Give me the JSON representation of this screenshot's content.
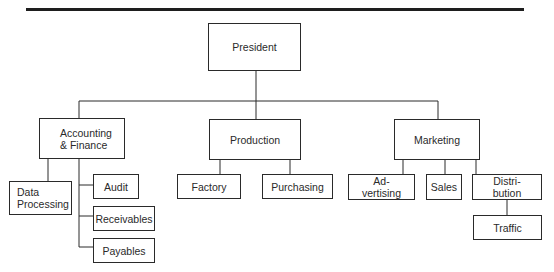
{
  "chart": {
    "root": {
      "label": "President"
    },
    "departments": [
      {
        "label": "Accounting\n& Finance",
        "children": [
          {
            "label": "Data\nProcessing"
          },
          {
            "label": "Audit"
          },
          {
            "label": "Receivables"
          },
          {
            "label": "Payables"
          }
        ]
      },
      {
        "label": "Production",
        "children": [
          {
            "label": "Factory"
          },
          {
            "label": "Purchasing"
          }
        ]
      },
      {
        "label": "Marketing",
        "children": [
          {
            "label": "Ad-\nvertising"
          },
          {
            "label": "Sales"
          },
          {
            "label": "Distri-\nbution",
            "children": [
              {
                "label": "Traffic"
              }
            ]
          }
        ]
      }
    ]
  },
  "colors": {
    "line": "#2a2a2a",
    "rule": "#1e1e1e",
    "background": "#ffffff"
  }
}
